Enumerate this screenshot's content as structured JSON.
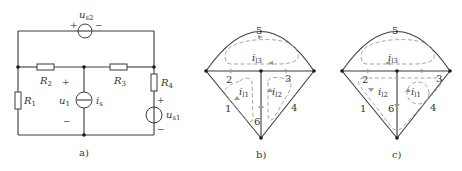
{
  "figure_a": {
    "caption": "a)",
    "sources": {
      "us2": {
        "label": "u",
        "sub": "s2",
        "plus": "+",
        "minus": "−"
      },
      "us1": {
        "label": "u",
        "sub": "s1",
        "plus": "+",
        "minus": "−"
      },
      "is": {
        "label": "i",
        "sub": "s"
      }
    },
    "resistors": [
      {
        "label": "R",
        "sub": "1"
      },
      {
        "label": "R",
        "sub": "2"
      },
      {
        "label": "R",
        "sub": "3"
      },
      {
        "label": "R",
        "sub": "4"
      }
    ],
    "voltage_u1": {
      "label": "u",
      "sub": "1",
      "plus": "+",
      "minus": "−"
    }
  },
  "figure_b": {
    "caption": "b)",
    "branches": [
      "1",
      "2",
      "3",
      "4",
      "5",
      "6"
    ],
    "loops": [
      {
        "label": "i",
        "sub": "l1"
      },
      {
        "label": "i",
        "sub": "l2"
      },
      {
        "label": "i",
        "sub": "l3"
      }
    ]
  },
  "figure_c": {
    "caption": "c)",
    "branches": [
      "1",
      "2",
      "3",
      "4",
      "5",
      "6"
    ],
    "loops": [
      {
        "label": "i",
        "sub": "l1"
      },
      {
        "label": "i",
        "sub": "l2"
      },
      {
        "label": "i",
        "sub": "l3"
      }
    ]
  },
  "colors": {
    "wire": "#3a3a3a",
    "dashed_loop": "#9a9a9a",
    "node": "#1a1a1a"
  }
}
